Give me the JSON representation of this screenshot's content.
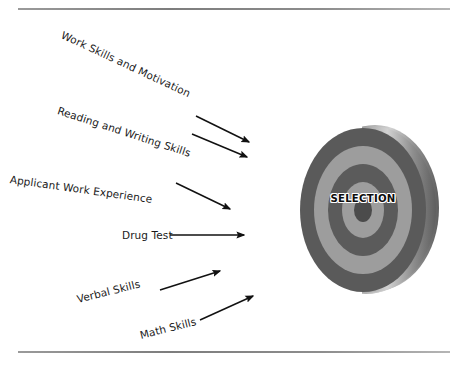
{
  "figure": {
    "background_color": "#ffffff",
    "rules": {
      "top_label": "top-divider-rule",
      "bottom_label": "bottom-divider-rule",
      "color": "#8d8d8d"
    }
  },
  "inputs": [
    {
      "id": "work-skills-and-motivation",
      "label": "Work Skills and Motivation",
      "rotation_deg": 25
    },
    {
      "id": "reading-and-writing-skills",
      "label": "Reading and Writing Skills",
      "rotation_deg": 18
    },
    {
      "id": "applicant-work-experience",
      "label": "Applicant Work Experience",
      "rotation_deg": 8
    },
    {
      "id": "drug-test",
      "label": "Drug Test",
      "rotation_deg": 0
    },
    {
      "id": "verbal-skills",
      "label": "Verbal Skills",
      "rotation_deg": -14
    },
    {
      "id": "math-skills",
      "label": "Math Skills",
      "rotation_deg": -14
    }
  ],
  "arrows": [
    {
      "id": "arrow-work-skills",
      "from": [
        196,
        116
      ],
      "to": [
        251,
        143
      ],
      "direction": "down-right"
    },
    {
      "id": "arrow-reading-writing",
      "from": [
        192,
        133
      ],
      "to": [
        249,
        158
      ],
      "direction": "down-right"
    },
    {
      "id": "arrow-applicant",
      "from": [
        176,
        183
      ],
      "to": [
        232,
        210
      ],
      "direction": "down-right"
    },
    {
      "id": "arrow-drug-test",
      "from": [
        170,
        235
      ],
      "to": [
        246,
        235
      ],
      "direction": "right"
    },
    {
      "id": "arrow-verbal-skills",
      "from": [
        160,
        290
      ],
      "to": [
        222,
        272
      ],
      "direction": "up-right"
    },
    {
      "id": "arrow-math-skills",
      "from": [
        200,
        320
      ],
      "to": [
        255,
        296
      ],
      "direction": "up-right"
    }
  ],
  "target": {
    "center_label": "SELECTION",
    "ring_count": 5,
    "colors": {
      "outer_ring_dark": "#5a5a5a",
      "ring_light": "#9e9e9e",
      "ring_dark": "#5c5c5c",
      "bullseye": "#4d4d4d",
      "side_rim_light": "#c9c9c9",
      "side_rim_dark": "#6a6a6a",
      "text_color": "#0d0d0d",
      "text_outline": "#ffffff"
    }
  }
}
